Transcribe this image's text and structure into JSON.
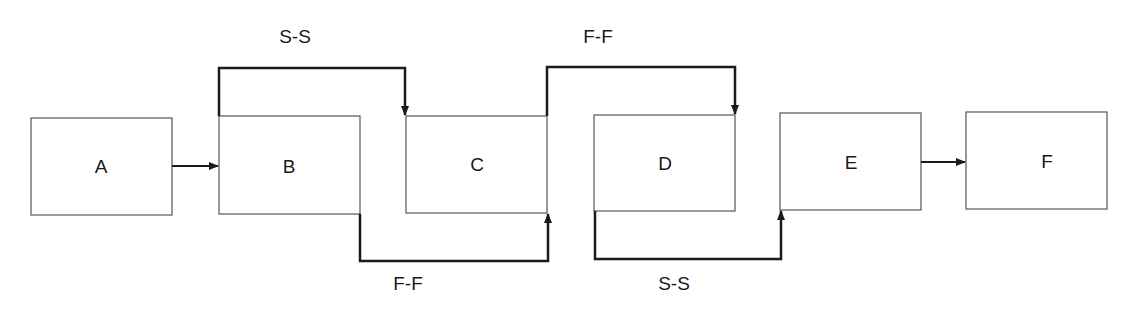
{
  "diagram": {
    "type": "precedence-network",
    "activities": [
      {
        "id": "A",
        "label": "A"
      },
      {
        "id": "B",
        "label": "B"
      },
      {
        "id": "C",
        "label": "C"
      },
      {
        "id": "D",
        "label": "D"
      },
      {
        "id": "E",
        "label": "E"
      },
      {
        "id": "F",
        "label": "F"
      }
    ],
    "relationships": [
      {
        "from": "A",
        "to": "B",
        "type": "F-S",
        "label": ""
      },
      {
        "from": "B",
        "to": "C",
        "type": "S-S",
        "label": "S-S"
      },
      {
        "from": "B",
        "to": "C",
        "type": "F-F",
        "label": "F-F"
      },
      {
        "from": "C",
        "to": "D",
        "type": "F-F",
        "label": "F-F"
      },
      {
        "from": "D",
        "to": "E",
        "type": "S-S",
        "label": "S-S"
      },
      {
        "from": "E",
        "to": "F",
        "type": "F-S",
        "label": ""
      }
    ],
    "colors": {
      "line": "#1a1a1a",
      "box_border": "#555555",
      "background": "#ffffff"
    }
  }
}
